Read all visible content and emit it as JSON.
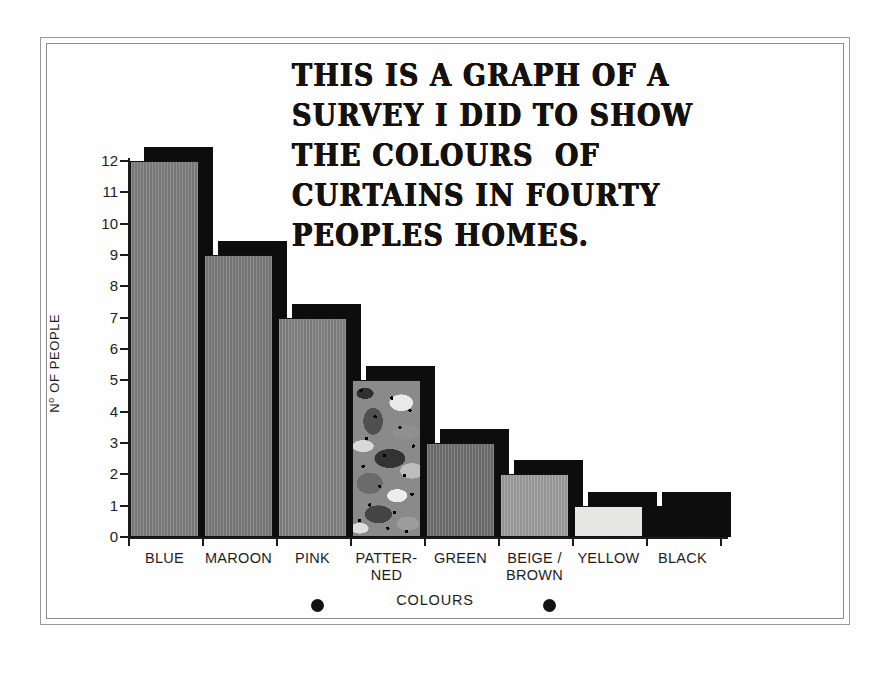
{
  "title": {
    "lines": [
      "THIS IS A GRAPH OF A",
      "SURVEY I DID TO SHOW",
      "THE COLOURS  OF",
      "CURTAINS IN FOURTY",
      "PEOPLES HOMES."
    ],
    "full_text": "THIS IS A GRAPH OF A SURVEY I DID TO SHOW THE COLOURS OF CURTAINS IN FOURTY PEOPLES HOMES."
  },
  "axes": {
    "y_label_prefix": "N",
    "y_label_sup": "o",
    "y_label_rest": " OF PEOPLE",
    "y_label_full": "No OF PEOPLE",
    "x_label": "COLOURS",
    "y_ticks": [
      "12",
      "11",
      "10",
      "9",
      "8",
      "7",
      "6",
      "5",
      "4",
      "3",
      "2",
      "1",
      "0"
    ]
  },
  "chart_data": {
    "type": "bar",
    "title": "THIS IS A GRAPH OF A SURVEY I DID TO SHOW THE COLOURS OF CURTAINS IN FOURTY PEOPLES HOMES.",
    "xlabel": "COLOURS",
    "ylabel": "No OF PEOPLE",
    "ylim": [
      0,
      12
    ],
    "ytick_step": 1,
    "grid": false,
    "legend": "none",
    "style": "hand-drawn 3D bars with black drop shadow",
    "categories": [
      "BLUE",
      "MAROON",
      "PINK",
      "PATTERNED",
      "GREEN",
      "BEIGE / BROWN",
      "YELLOW",
      "BLACK"
    ],
    "values": [
      12,
      9,
      7,
      5,
      3,
      2,
      1,
      1
    ],
    "total": 40
  },
  "bars": [
    {
      "label_lines": [
        "BLUE"
      ],
      "value": 12,
      "fill": "#7d7d7d",
      "texture": "striate"
    },
    {
      "label_lines": [
        "MAROON"
      ],
      "value": 9,
      "fill": "#7a7a7a",
      "texture": "striate"
    },
    {
      "label_lines": [
        "PINK"
      ],
      "value": 7,
      "fill": "#818181",
      "texture": "striate"
    },
    {
      "label_lines": [
        "PATTER-",
        "NED"
      ],
      "value": 5,
      "fill": "#8a8a8a",
      "texture": "camo"
    },
    {
      "label_lines": [
        "GREEN"
      ],
      "value": 3,
      "fill": "#6e6e6e",
      "texture": "striate"
    },
    {
      "label_lines": [
        "BEIGE /",
        "BROWN"
      ],
      "value": 2,
      "fill": "#9c9c9c",
      "texture": "striate"
    },
    {
      "label_lines": [
        "YELLOW"
      ],
      "value": 1,
      "fill": "#e6e6e4",
      "texture": "plain"
    },
    {
      "label_lines": [
        "BLACK"
      ],
      "value": 1,
      "fill": "#0d0d0d",
      "texture": "plain"
    }
  ],
  "marks": {
    "dot_count": 2,
    "shadow_color": "#0d0d0d",
    "ink_color": "#1b1b1b",
    "paper_color": "#fefefe"
  }
}
